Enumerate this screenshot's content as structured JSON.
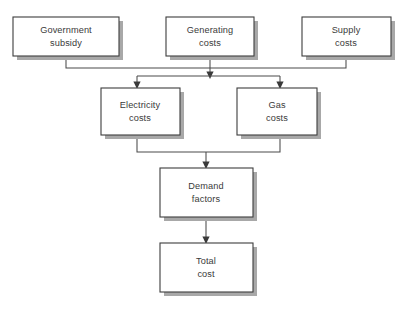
{
  "diagram": {
    "type": "flowchart",
    "background_color": "#ffffff",
    "box_fill_color": "#ffffff",
    "box_border_color": "#3d3d3d",
    "box_shadow_color": "#a8a8a8",
    "text_color": "#3a3a3a",
    "connector_color": "#4a4a4a",
    "nodes": [
      {
        "id": "government-subsidy",
        "label_line1": "Government",
        "label_line2": "subsidy",
        "x": 13,
        "y": 17,
        "width": 106,
        "height": 39,
        "row": 1
      },
      {
        "id": "generating-costs",
        "label_line1": "Generating",
        "label_line2": "costs",
        "x": 166,
        "y": 17,
        "width": 88,
        "height": 39,
        "row": 1
      },
      {
        "id": "supply-costs",
        "label_line1": "Supply",
        "label_line2": "costs",
        "x": 302,
        "y": 17,
        "width": 89,
        "height": 39,
        "row": 1
      },
      {
        "id": "electricity-costs",
        "label_line1": "Electricity",
        "label_line2": "costs",
        "x": 101,
        "y": 88,
        "width": 79,
        "height": 47,
        "row": 2
      },
      {
        "id": "gas-costs",
        "label_line1": "Gas",
        "label_line2": "costs",
        "x": 237,
        "y": 88,
        "width": 80,
        "height": 47,
        "row": 2
      },
      {
        "id": "demand-factors",
        "label_line1": "Demand",
        "label_line2": "factors",
        "x": 160,
        "y": 168,
        "width": 93,
        "height": 49,
        "row": 3
      },
      {
        "id": "total-cost",
        "label_line1": "Total",
        "label_line2": "cost",
        "x": 160,
        "y": 243,
        "width": 93,
        "height": 49,
        "row": 4
      }
    ],
    "edges": [
      {
        "id": "edge-government-subsidy-to-bus",
        "from": "government-subsidy",
        "to": "bus-upper",
        "has_arrowhead": false
      },
      {
        "id": "edge-supply-costs-to-bus",
        "from": "supply-costs",
        "to": "bus-upper",
        "has_arrowhead": false
      },
      {
        "id": "edge-generating-costs-to-distribution",
        "from": "generating-costs",
        "to": "distribution-bar",
        "has_arrowhead": true
      },
      {
        "id": "edge-distribution-to-electricity-costs",
        "from": "distribution-bar",
        "to": "electricity-costs",
        "has_arrowhead": true
      },
      {
        "id": "edge-distribution-to-gas-costs",
        "from": "distribution-bar",
        "to": "gas-costs",
        "has_arrowhead": true
      },
      {
        "id": "edge-electricity-costs-to-merge",
        "from": "electricity-costs",
        "to": "merge-bar",
        "has_arrowhead": false
      },
      {
        "id": "edge-gas-costs-to-merge",
        "from": "gas-costs",
        "to": "merge-bar",
        "has_arrowhead": false
      },
      {
        "id": "edge-merge-to-demand-factors",
        "from": "merge-bar",
        "to": "demand-factors",
        "has_arrowhead": true
      },
      {
        "id": "edge-demand-factors-to-total-cost",
        "from": "demand-factors",
        "to": "total-cost",
        "has_arrowhead": true
      }
    ]
  }
}
